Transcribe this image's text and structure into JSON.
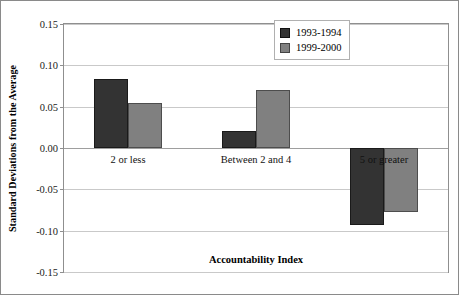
{
  "chart_data": {
    "type": "bar",
    "title": "",
    "xlabel": "Accountability Index",
    "ylabel": "Standard Deviations from the Average",
    "categories": [
      "2 or less",
      "Between 2 and 4",
      "5 or greater"
    ],
    "series": [
      {
        "name": "1993-1994",
        "color": "#333333",
        "values": [
          0.083,
          0.021,
          -0.093
        ]
      },
      {
        "name": "1999-2000",
        "color": "#808080",
        "values": [
          0.054,
          0.07,
          -0.077
        ]
      }
    ],
    "ylim": [
      -0.15,
      0.15
    ],
    "ytick_values": [
      0.15,
      0.1,
      0.05,
      0.0,
      -0.05,
      -0.1,
      -0.15
    ],
    "ytick_labels": [
      "0.15",
      "0.10",
      "0.05",
      "0.00",
      "-0.05",
      "-0.10",
      "-0.15"
    ],
    "grid": true,
    "grid_axis": "y",
    "legend_position": "top-right",
    "zero_line": 0.0
  },
  "legend": {
    "entries": [
      {
        "label": "1993-1994"
      },
      {
        "label": "1999-2000"
      }
    ]
  },
  "axes": {
    "y_title": "Standard Deviations from the Average",
    "x_title": "Accountability Index"
  }
}
